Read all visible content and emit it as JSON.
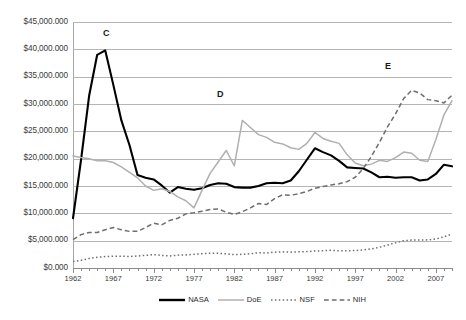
{
  "chart_data": {
    "type": "line",
    "title": "",
    "subtitle": "",
    "xlabel": "",
    "ylabel": "",
    "xlim": [
      1962,
      2009
    ],
    "ylim": [
      0,
      45000
    ],
    "grid": true,
    "legend_position": "bottom",
    "y_tick_labels": [
      "$45,000.000",
      "$40,000.000",
      "$35,000.000",
      "$30,000.000",
      "$25,000.000",
      "$20,000.000",
      "$15,000.000",
      "$10,000.000",
      "$5,000.000",
      "$0.000"
    ],
    "y_tick_values": [
      45000,
      40000,
      35000,
      30000,
      25000,
      20000,
      15000,
      10000,
      5000,
      0
    ],
    "x_tick_labels": [
      "1962",
      "1967",
      "1972",
      "1977",
      "1982",
      "1987",
      "1992",
      "1997",
      "2002",
      "2007"
    ],
    "x_tick_values": [
      1962,
      1967,
      1972,
      1977,
      1982,
      1987,
      1992,
      1997,
      2002,
      2007
    ],
    "x": [
      1962,
      1963,
      1964,
      1965,
      1966,
      1967,
      1968,
      1969,
      1970,
      1971,
      1972,
      1973,
      1974,
      1975,
      1976,
      1977,
      1978,
      1979,
      1980,
      1981,
      1982,
      1983,
      1984,
      1985,
      1986,
      1987,
      1988,
      1989,
      1990,
      1991,
      1992,
      1993,
      1994,
      1995,
      1996,
      1997,
      1998,
      1999,
      2000,
      2001,
      2002,
      2003,
      2004,
      2005,
      2006,
      2007,
      2008,
      2009
    ],
    "series": [
      {
        "name": "NASA",
        "color": "#000000",
        "style": "solid",
        "values": [
          9100,
          19800,
          31500,
          39000,
          39800,
          33500,
          27000,
          22500,
          17000,
          16500,
          16200,
          15100,
          13800,
          14800,
          14500,
          14300,
          14600,
          15200,
          15500,
          15400,
          14800,
          14700,
          14700,
          15000,
          15500,
          15600,
          15500,
          16000,
          17700,
          19800,
          21900,
          21200,
          20600,
          19600,
          18400,
          18300,
          18200,
          17500,
          16600,
          16700,
          16500,
          16600,
          16600,
          16000,
          16200,
          17200,
          18900,
          18600
        ]
      },
      {
        "name": "DoE",
        "color": "#b0b0b0",
        "style": "solid",
        "values": [
          20500,
          20200,
          20000,
          19600,
          19600,
          19300,
          18500,
          17500,
          16500,
          15000,
          14200,
          14500,
          14000,
          13000,
          12300,
          11000,
          14200,
          17300,
          19400,
          21500,
          18700,
          27000,
          25700,
          24400,
          23900,
          23000,
          22700,
          22000,
          21700,
          22800,
          24800,
          23700,
          23200,
          22800,
          20700,
          19200,
          18700,
          19000,
          19700,
          19500,
          20200,
          21200,
          21000,
          19700,
          19500,
          23500,
          28000,
          30600
        ]
      },
      {
        "name": "NSF",
        "color": "#6e6e6e",
        "style": "dotted",
        "values": [
          1200,
          1400,
          1750,
          1950,
          2100,
          2150,
          2150,
          2100,
          2200,
          2300,
          2450,
          2300,
          2200,
          2350,
          2400,
          2500,
          2600,
          2700,
          2700,
          2600,
          2450,
          2500,
          2600,
          2800,
          2750,
          2900,
          2950,
          2900,
          2950,
          3000,
          3100,
          3150,
          3250,
          3150,
          3150,
          3200,
          3300,
          3500,
          3800,
          4200,
          4600,
          5000,
          5100,
          5100,
          5150,
          5300,
          5700,
          6200
        ]
      },
      {
        "name": "NIH",
        "color": "#6e6e6e",
        "style": "dashed",
        "values": [
          5200,
          6100,
          6500,
          6500,
          7000,
          7400,
          7000,
          6700,
          6700,
          7400,
          8200,
          7900,
          8700,
          9100,
          9900,
          10100,
          10400,
          10700,
          10800,
          10200,
          9800,
          10300,
          11000,
          11800,
          11600,
          12700,
          13400,
          13300,
          13600,
          14000,
          14600,
          14900,
          15200,
          15400,
          15800,
          16600,
          18200,
          20400,
          23000,
          25800,
          28200,
          31000,
          32500,
          32000,
          30800,
          30600,
          30200,
          31600
        ]
      }
    ],
    "annotations": [
      {
        "label": "C",
        "x_px": 103,
        "y_px": 28
      },
      {
        "label": "D",
        "x_px": 217,
        "y_px": 89
      },
      {
        "label": "E",
        "x_px": 385,
        "y_px": 61
      }
    ]
  },
  "legend": {
    "items": [
      {
        "label": "NASA",
        "color": "#000000",
        "style": "solid"
      },
      {
        "label": "DoE",
        "color": "#b0b0b0",
        "style": "solid"
      },
      {
        "label": "NSF",
        "color": "#6e6e6e",
        "style": "dotted"
      },
      {
        "label": "NIH",
        "color": "#6e6e6e",
        "style": "dashed"
      }
    ]
  }
}
